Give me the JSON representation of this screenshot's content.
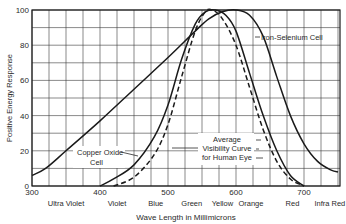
{
  "chart_data": {
    "type": "line",
    "title": "",
    "xlabel": "Wave Length in Millimicrons",
    "ylabel": "Positive Energy Response",
    "xlim": [
      300,
      750
    ],
    "ylim": [
      0,
      100
    ],
    "grid": true,
    "x_ticks": [
      300,
      400,
      500,
      600,
      700
    ],
    "y_ticks": [
      0,
      20,
      40,
      60,
      80,
      100
    ],
    "color_band_labels": [
      {
        "label": "Ultra Violet",
        "x": 350
      },
      {
        "label": "Violet",
        "x": 425
      },
      {
        "label": "Blue",
        "x": 482
      },
      {
        "label": "Green",
        "x": 535
      },
      {
        "label": "Yellow",
        "x": 580
      },
      {
        "label": "Orange",
        "x": 622
      },
      {
        "label": "Red",
        "x": 683
      },
      {
        "label": "Infra Red",
        "x": 738
      }
    ],
    "series": [
      {
        "name": "Iron-Selenium Cell",
        "style": "solid",
        "x": [
          300,
          320,
          350,
          400,
          450,
          500,
          540,
          560,
          580,
          600,
          620,
          640,
          660,
          680,
          700,
          720,
          740,
          750
        ],
        "values": [
          6,
          10,
          20,
          37,
          55,
          73,
          88,
          95,
          99,
          100,
          97,
          85,
          62,
          40,
          24,
          14,
          9,
          8
        ]
      },
      {
        "name": "Copper Oxide Cell",
        "style": "solid",
        "x": [
          400,
          420,
          450,
          480,
          500,
          520,
          540,
          555,
          570,
          585,
          600,
          620,
          640,
          660,
          680,
          700
        ],
        "values": [
          0,
          4,
          12,
          28,
          46,
          72,
          92,
          99,
          100,
          97,
          88,
          64,
          40,
          20,
          6,
          0
        ]
      },
      {
        "name": "Average Visibility Curve for Human Eye",
        "style": "dashed",
        "x": [
          420,
          450,
          480,
          500,
          520,
          540,
          555,
          565,
          580,
          600,
          620,
          640,
          660,
          680,
          700
        ],
        "values": [
          0,
          5,
          18,
          35,
          62,
          88,
          99,
          100,
          95,
          80,
          56,
          32,
          14,
          4,
          0
        ]
      }
    ],
    "annotations": [
      {
        "text": "Iron-Selenium Cell",
        "target": "Iron-Selenium Cell"
      },
      {
        "text": "Copper Oxide\nCell",
        "target": "Copper Oxide Cell"
      },
      {
        "text": "Average\nVisibility Curve\nfor Human Eye",
        "target": "Average Visibility Curve for Human Eye"
      }
    ]
  },
  "labels": {
    "xlabel": "Wave Length in Millimicrons",
    "ylabel": "Positive Energy Response",
    "iron": "Iron-Selenium Cell",
    "copper1": "Copper Oxide",
    "copper2": "Cell",
    "vis1": "Average",
    "vis2": "Visibility Curve",
    "vis3": "for Human Eye"
  },
  "colors": {
    "line": "#1a1a1a",
    "grid": "#3a3a3a",
    "text": "#2a2a2a"
  }
}
